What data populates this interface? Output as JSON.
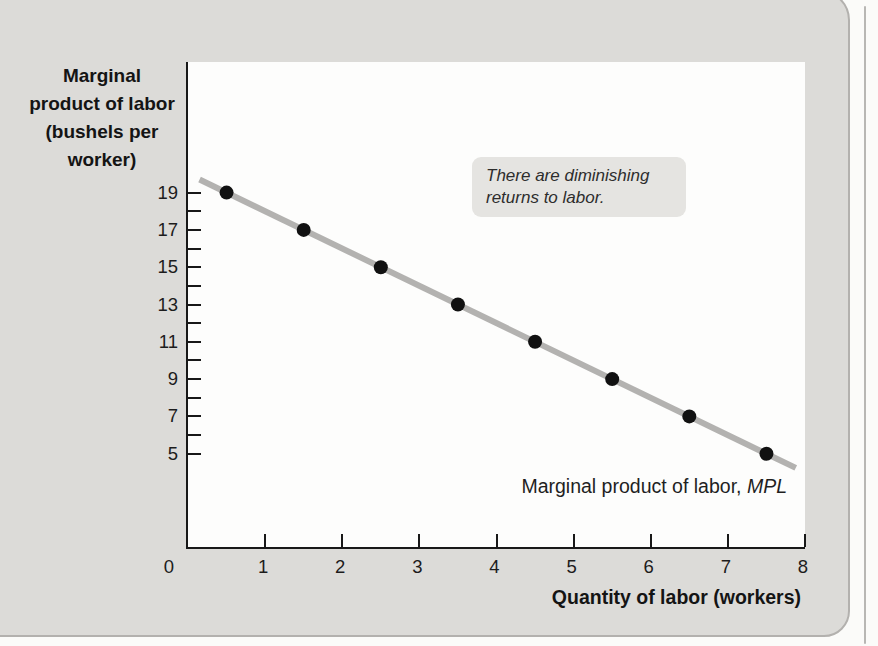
{
  "panel": {
    "background": "#dcdbd8",
    "border_color": "#b3b1ae"
  },
  "chart_data": {
    "type": "scatter",
    "title": "",
    "series": [
      {
        "name": "Marginal product of labor, MPL",
        "x": [
          0.5,
          1.5,
          2.5,
          3.5,
          4.5,
          5.5,
          6.5,
          7.5
        ],
        "y": [
          19,
          17,
          15,
          13,
          11,
          9,
          7,
          5
        ],
        "point_color": "#111111",
        "line": {
          "x0": 0.15,
          "y0": 19.7,
          "x1": 7.88,
          "y1": 4.24,
          "color": "#b3b2b0"
        }
      }
    ],
    "xlabel": "Quantity of labor (workers)",
    "ylabel": "Marginal\nproduct of labor\n(bushels per\nworker)",
    "xlim": [
      0,
      8
    ],
    "ylim": [
      0,
      26
    ],
    "xticks": [
      0,
      1,
      2,
      3,
      4,
      5,
      6,
      7,
      8
    ],
    "yticks_minor": [
      5,
      6,
      7,
      8,
      9,
      10,
      11,
      12,
      13,
      14,
      15,
      16,
      17,
      18,
      19
    ],
    "yticks_labeled": [
      5,
      7,
      9,
      11,
      13,
      15,
      17,
      19
    ],
    "grid": false,
    "legend": "none",
    "annotation": "There are diminishing returns to labor.",
    "line_label": {
      "prefix": "Marginal product of labor, ",
      "italic": "MPL"
    }
  }
}
